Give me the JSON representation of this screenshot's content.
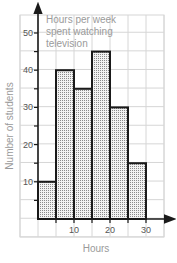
{
  "chart_data": {
    "type": "bar",
    "subtype": "histogram",
    "title_lines": [
      "Hours per week",
      "spent watching",
      "television"
    ],
    "xlabel": "Hours",
    "ylabel": "Number of students",
    "bins": [
      [
        0,
        5
      ],
      [
        5,
        10
      ],
      [
        10,
        15
      ],
      [
        15,
        20
      ],
      [
        20,
        25
      ],
      [
        25,
        30
      ]
    ],
    "categories": [
      "0-5",
      "5-10",
      "10-15",
      "15-20",
      "20-25",
      "25-30"
    ],
    "values": [
      10,
      40,
      35,
      45,
      30,
      15
    ],
    "xticks": [
      10,
      20,
      30
    ],
    "yticks": [
      10,
      20,
      30,
      40,
      50
    ],
    "xlim": [
      -3.5,
      36.5
    ],
    "ylim": [
      0,
      55
    ],
    "grid": true,
    "legend": "none",
    "bar_fill": "dotted gray",
    "bar_edge_color": "#1a1a1a"
  }
}
